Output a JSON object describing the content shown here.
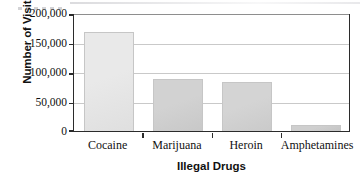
{
  "chart_data": {
    "type": "bar",
    "title": "",
    "subtitle": "",
    "categories": [
      "Cocaine",
      "Marijuana",
      "Heroin",
      "Amphetamines"
    ],
    "values": [
      167000,
      88000,
      83000,
      11000
    ],
    "xlabel": "Illegal Drugs",
    "ylabel": "Number of Visits",
    "ylim": [
      0,
      200000
    ],
    "yticks": [
      0,
      50000,
      100000,
      150000,
      200000
    ],
    "ytick_labels": [
      "0",
      "50,000",
      "100,000",
      "150,000",
      "200,000"
    ],
    "grid": true,
    "legend": false,
    "legend_position": "none",
    "bar_colors": [
      "#e9e9e9",
      "#d2d2d2",
      "#d4d4d4",
      "#cfcfcf"
    ],
    "bar_border_color": "#c6c6c6",
    "axis_color": "#2b2b2b",
    "gridline_color": "#c9c9c9",
    "background": "#ffffff"
  }
}
